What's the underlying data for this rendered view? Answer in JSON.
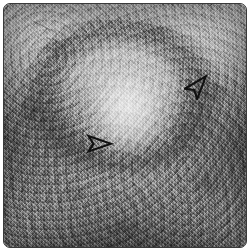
{
  "figure": {
    "modality": "grayscale ultrasound sonogram",
    "title": "",
    "caption": "",
    "border_color": "#3a3a3a",
    "background_color": "#ffffff",
    "frame": {
      "width_px": 244,
      "height_px": 245,
      "corner_radius_px": 7
    }
  },
  "image_content": {
    "description": "Mottled grayscale speckle field with a central brighter oval lesion surrounded by a darker hypoechoic halo; periphery and inferior field are darker.",
    "regions": [
      {
        "name": "central-lesion",
        "label": "hyperechoic central lesion",
        "tone": "bright",
        "center_x": 121,
        "center_y": 104
      },
      {
        "name": "hypoechoic-halo",
        "label": "darker halo rim",
        "tone": "dark",
        "center_x": 119,
        "center_y": 101
      },
      {
        "name": "superior-field",
        "label": "brighter superior speckle",
        "tone": "light",
        "center_x": 125,
        "center_y": 35
      },
      {
        "name": "lateral-left-field",
        "label": "darker left lateral field",
        "tone": "dark",
        "center_x": 25,
        "center_y": 140
      },
      {
        "name": "lateral-right-field",
        "label": "darker right lateral field",
        "tone": "dark",
        "center_x": 220,
        "center_y": 145
      },
      {
        "name": "inferior-field",
        "label": "darker inferior field",
        "tone": "dark",
        "center_x": 125,
        "center_y": 215
      }
    ],
    "artifacts": [
      {
        "name": "scratch-artifact",
        "label": "faint diagonal linear artifact",
        "x": 24,
        "y": 14
      }
    ]
  },
  "annotations": {
    "arrow_color": "#111111",
    "arrow_style": "hollow outline arrowhead",
    "items": [
      {
        "name": "arrow-lesion-margin",
        "label": "arrow marking lesion margin",
        "direction": "right",
        "rotation_deg": 0,
        "x": 82,
        "y": 129,
        "width": 28,
        "height": 22
      },
      {
        "name": "arrow-posterior-wall",
        "label": "arrow marking posterior wall",
        "direction": "up-right",
        "rotation_deg": -50,
        "x": 180,
        "y": 66,
        "width": 30,
        "height": 30
      }
    ]
  }
}
